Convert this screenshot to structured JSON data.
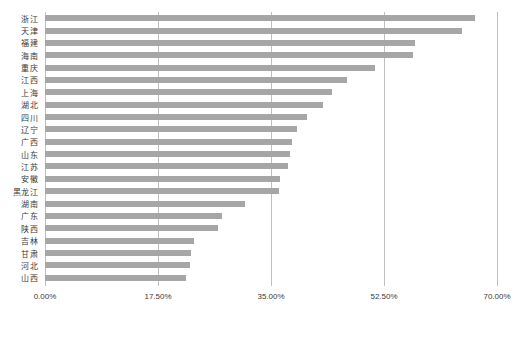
{
  "chart_data": {
    "type": "bar",
    "orientation": "horizontal",
    "title": "",
    "subtitle": "",
    "xlabel": "",
    "ylabel": "",
    "xlim": [
      0,
      70
    ],
    "xtick_labels": [
      "0.00%",
      "17.50%",
      "35.00%",
      "52.50%",
      "70.00%"
    ],
    "xtick_values": [
      0,
      17.5,
      35,
      52.5,
      70
    ],
    "grid": "vertical",
    "legend": "none",
    "bar_color": "#a6a6a6",
    "gridline_color": "#bfbfbf",
    "axis_color": "#9e9e9e",
    "categories": [
      "浙江",
      "天津",
      "福建",
      "海南",
      "重庆",
      "江西",
      "上海",
      "湖北",
      "四川",
      "辽宁",
      "广西",
      "山东",
      "江苏",
      "安徽",
      "黑龙江",
      "湖南",
      "广东",
      "陕西",
      "吉林",
      "甘肃",
      "河北",
      "山西"
    ],
    "values": [
      66.6,
      64.6,
      57.3,
      57.0,
      51.1,
      46.7,
      44.4,
      43.1,
      40.5,
      39.0,
      38.2,
      38.0,
      37.6,
      36.4,
      36.2,
      31.0,
      27.4,
      26.8,
      23.1,
      22.6,
      22.4,
      21.8
    ],
    "series": [
      {
        "name": "",
        "values": [
          66.6,
          64.6,
          57.3,
          57.0,
          51.1,
          46.7,
          44.4,
          43.1,
          40.5,
          39.0,
          38.2,
          38.0,
          37.6,
          36.4,
          36.2,
          31.0,
          27.4,
          26.8,
          23.1,
          22.6,
          22.4,
          21.8
        ]
      }
    ]
  }
}
